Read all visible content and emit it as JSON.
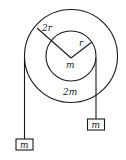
{
  "diagram": {
    "type": "double pulley",
    "outer_disk": {
      "radius_label": "2r",
      "mass_label": "2m"
    },
    "inner_disk": {
      "radius_label": "r",
      "mass_label": "m"
    },
    "blocks": [
      {
        "label": "m",
        "position": "left",
        "hangs_from": "outer disk"
      },
      {
        "label": "m",
        "position": "right",
        "hangs_from": "inner disk"
      }
    ],
    "colors": {
      "stroke": "#1a1a1a",
      "background": "#ffffff"
    }
  }
}
